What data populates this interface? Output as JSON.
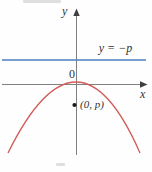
{
  "figure": {
    "labels": {
      "y_axis": "y",
      "x_axis": "x",
      "origin": "0",
      "directrix_equation": "y = −p",
      "point": "(0, p)"
    },
    "colors": {
      "directrix": "#4d7ec3",
      "parabola": "#d15b58",
      "axis": "#808080",
      "arrow": "#3f3f3f",
      "point": "#1a1a1a",
      "text": "#333333"
    }
  }
}
